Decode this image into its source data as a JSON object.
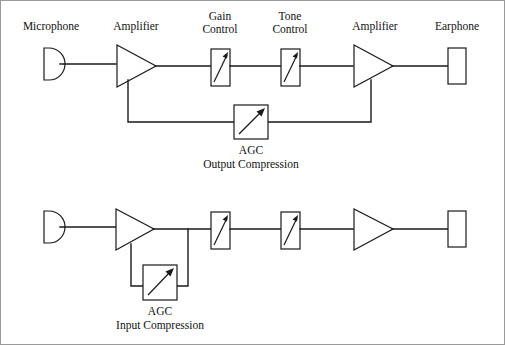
{
  "figure": {
    "background_color": "#ffffff",
    "line_color": "#1a1a1a",
    "border_color": "#9a9a9a"
  },
  "diagrams": [
    {
      "id": "output-compression",
      "caption_line1": "AGC",
      "caption_line2": "Output Compression",
      "labels": [
        {
          "key": "microphone",
          "text": "Microphone",
          "lines": [
            "Microphone"
          ]
        },
        {
          "key": "amplifier-1",
          "text": "Amplifier",
          "lines": [
            "Amplifier"
          ]
        },
        {
          "key": "gain-control",
          "text": "Gain Control",
          "lines": [
            "Gain",
            "Control"
          ]
        },
        {
          "key": "tone-control",
          "text": "Tone Control",
          "lines": [
            "Tone",
            "Control"
          ]
        },
        {
          "key": "amplifier-2",
          "text": "Amplifier",
          "lines": [
            "Amplifier"
          ]
        },
        {
          "key": "earphone",
          "text": "Earphone",
          "lines": [
            "Earphone"
          ]
        }
      ],
      "blocks": [
        {
          "key": "microphone",
          "type": "microphone-symbol"
        },
        {
          "key": "amplifier-1",
          "type": "amplifier-triangle"
        },
        {
          "key": "gain-control",
          "type": "potentiometer-box"
        },
        {
          "key": "tone-control",
          "type": "potentiometer-box"
        },
        {
          "key": "amplifier-2",
          "type": "amplifier-triangle"
        },
        {
          "key": "earphone",
          "type": "earphone-box"
        },
        {
          "key": "agc",
          "type": "agc-square"
        }
      ],
      "feedback": "from output amplifier back to input amplifier through AGC"
    },
    {
      "id": "input-compression",
      "caption_line1": "AGC",
      "caption_line2": "Input Compression",
      "labels": [],
      "blocks": [
        {
          "key": "microphone",
          "type": "microphone-symbol"
        },
        {
          "key": "amplifier-1",
          "type": "amplifier-triangle"
        },
        {
          "key": "gain-control",
          "type": "potentiometer-box"
        },
        {
          "key": "tone-control",
          "type": "potentiometer-box"
        },
        {
          "key": "amplifier-2",
          "type": "amplifier-triangle"
        },
        {
          "key": "earphone",
          "type": "earphone-box"
        },
        {
          "key": "agc",
          "type": "agc-square"
        }
      ],
      "feedback": "from preamplifier output back to preamplifier through AGC"
    }
  ],
  "text": {
    "microphone": "Microphone",
    "amplifier1": "Amplifier",
    "gain_line1": "Gain",
    "gain_line2": "Control",
    "tone_line1": "Tone",
    "tone_line2": "Control",
    "amplifier2": "Amplifier",
    "earphone": "Earphone",
    "agc_top": "AGC",
    "agc_top_caption": "Output Compression",
    "agc_bottom": "AGC",
    "agc_bottom_caption": "Input Compression"
  }
}
